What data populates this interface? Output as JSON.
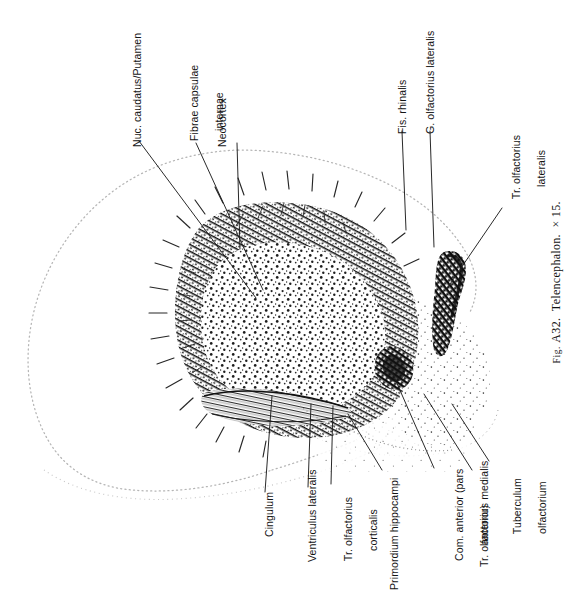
{
  "figure": {
    "number": "Fig. A32.",
    "fig_prefix": "Fig.",
    "fig_id": "A32.",
    "title": "Telencephalon.",
    "magnification": "× 15.",
    "caption_full": "Fig. A32.   Telencephalon.  ×  15.",
    "orientation": "rotated-90-ccw",
    "technique": "stipple-and-hatch line drawing",
    "ink_color": "#141414",
    "outline_color": "#b9b9b9",
    "background": "#ffffff"
  },
  "labels": [
    {
      "id": "nuc-caudatus-putamen",
      "text": "Nuc. caudatus/Putamen",
      "lines": [
        "Nuc. caudatus/Putamen"
      ]
    },
    {
      "id": "fibrae-capsulae-internae",
      "text": "Fibrae capsulae internae",
      "lines": [
        "Fibrae capsulae",
        "internae"
      ]
    },
    {
      "id": "neocortex",
      "text": "Neocortex",
      "lines": [
        "Neocortex"
      ]
    },
    {
      "id": "fis-rhinalis",
      "text": "Fis. rhinalis",
      "lines": [
        "Fis. rhinalis"
      ]
    },
    {
      "id": "g-olfactorius-lateralis",
      "text": "G. olfactorius lateralis",
      "lines": [
        "G. olfactorius lateralis"
      ]
    },
    {
      "id": "tr-olfactorius-lateralis",
      "text": "Tr. olfactorius lateralis",
      "lines": [
        "Tr. olfactorius",
        "lateralis"
      ]
    },
    {
      "id": "tuberculum-olfactorium",
      "text": "Tuberculum olfactorium",
      "lines": [
        "Tuberculum",
        "olfactorium"
      ]
    },
    {
      "id": "tr-olfactorius-medialis",
      "text": "Tr. olfactorius medialis",
      "lines": [
        "Tr. olfactorius medialis"
      ]
    },
    {
      "id": "com-anterior-pars-anterior",
      "text": "Com. anterior (pars anterior)",
      "lines": [
        "Com. anterior (pars",
        "anterior)"
      ]
    },
    {
      "id": "primordium-hippocampi",
      "text": "Primordium hippocampi",
      "lines": [
        "Primordium hippocampi"
      ]
    },
    {
      "id": "tr-olfactorius-corticalis",
      "text": "Tr. olfactorius corticalis",
      "lines": [
        "Tr. olfactorius",
        "corticalis"
      ]
    },
    {
      "id": "ventriculus-lateralis",
      "text": "Ventriculus lateralis",
      "lines": [
        "Ventriculus lateralis"
      ]
    },
    {
      "id": "cingulum",
      "text": "Cingulum",
      "lines": [
        "Cingulum"
      ]
    }
  ],
  "label_text": {
    "nuc_caudatus_putamen": "Nuc. caudatus/Putamen",
    "fibrae_capsulae_1": "Fibrae capsulae",
    "fibrae_capsulae_2": "internae",
    "neocortex": "Neocortex",
    "fis_rhinalis": "Fis. rhinalis",
    "g_olfactorius_lateralis": "G. olfactorius lateralis",
    "tr_olf_lat_1": "Tr. olfactorius",
    "tr_olf_lat_2": "lateralis",
    "tuberculum_1": "Tuberculum",
    "tuberculum_2": "olfactorium",
    "tr_olfactorius_medialis": "Tr. olfactorius medialis",
    "com_anterior_1": "Com. anterior (pars",
    "com_anterior_2": "anterior)",
    "primordium_hippocampi": "Primordium hippocampi",
    "tr_olf_cort_1": "Tr. olfactorius",
    "tr_olf_cort_2": "corticalis",
    "ventriculus_lateralis": "Ventriculus lateralis",
    "cingulum": "Cingulum"
  }
}
